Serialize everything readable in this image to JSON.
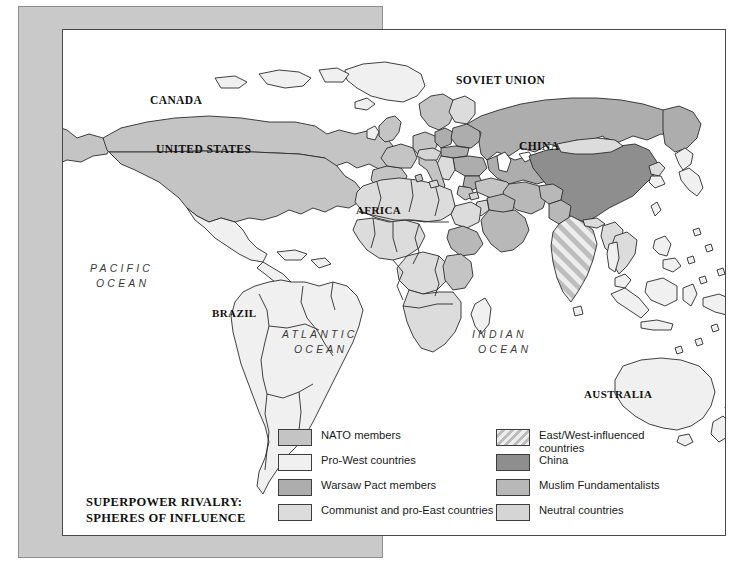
{
  "title": {
    "line1": "SUPERPOWER RIVALRY:",
    "line2": "SPHERES OF INFLUENCE"
  },
  "country_labels": [
    {
      "name": "canada",
      "text": "CANADA",
      "x": 87,
      "y": 70,
      "size": 11.5
    },
    {
      "name": "united-states",
      "text": "UNITED STATES",
      "x": 93,
      "y": 119,
      "size": 11.5
    },
    {
      "name": "soviet-union",
      "text": "SOVIET UNION",
      "x": 455,
      "y": 70,
      "size": 11.5
    },
    {
      "name": "china",
      "text": "CHINA",
      "x": 525,
      "y": 138,
      "size": 11.5
    },
    {
      "name": "africa",
      "text": "AFRICA",
      "x": 355,
      "y": 200,
      "size": 11.0
    },
    {
      "name": "brazil",
      "text": "BRAZIL",
      "x": 210,
      "y": 303,
      "size": 11.0
    },
    {
      "name": "australia",
      "text": "AUSTRALIA",
      "x": 583,
      "y": 386,
      "size": 11.0
    }
  ],
  "ocean_labels": [
    {
      "name": "pacific-ocean",
      "line1": "PACIFIC",
      "line2": "OCEAN",
      "x": 88,
      "y": 259,
      "size": 10.5
    },
    {
      "name": "atlantic-ocean",
      "line1": "ATLANTIC",
      "line2": "OCEAN",
      "x": 280,
      "y": 325,
      "size": 10.5
    },
    {
      "name": "indian-ocean",
      "line1": "INDIAN",
      "line2": "OCEAN",
      "x": 470,
      "y": 325,
      "size": 10.5
    }
  ],
  "legend": {
    "items": [
      {
        "name": "nato-members",
        "label": "NATO members",
        "swatch": "solid",
        "color": "#c4c4c4",
        "column": 0,
        "row": 0
      },
      {
        "name": "pro-west-countries",
        "label": "Pro-West countries",
        "swatch": "solid",
        "color": "#f0f0f0",
        "column": 0,
        "row": 1
      },
      {
        "name": "warsaw-pact-members",
        "label": "Warsaw Pact members",
        "swatch": "solid",
        "color": "#adadad",
        "column": 0,
        "row": 2
      },
      {
        "name": "communist-pro-east",
        "label": "Communist and pro-East countries",
        "swatch": "solid",
        "color": "#dcdcdc",
        "column": 0,
        "row": 3
      },
      {
        "name": "east-west-influenced",
        "label": "East/West-influenced countries",
        "swatch": "striped",
        "color": "#ededed",
        "column": 1,
        "row": 0
      },
      {
        "name": "china",
        "label": "China",
        "swatch": "solid",
        "color": "#8e8e8e",
        "column": 1,
        "row": 1
      },
      {
        "name": "muslim-fundamentalists",
        "label": "Muslim Fundamentalists",
        "swatch": "solid",
        "color": "#b8b8b8",
        "column": 1,
        "row": 2
      },
      {
        "name": "neutral-countries",
        "label": "Neutral countries",
        "swatch": "solid",
        "color": "#d5d5d5",
        "column": 1,
        "row": 3
      }
    ]
  },
  "colors": {
    "nato": "#c4c4c4",
    "pro_west": "#f0f0f0",
    "warsaw_pact": "#adadad",
    "communist": "#dcdcdc",
    "china": "#8e8e8e",
    "muslim": "#b8b8b8",
    "neutral": "#d5d5d5",
    "outline": "#2b2b2b",
    "backdrop": "#c9c9c9",
    "frame_border": "#4a4a4a",
    "ocean": "#ffffff"
  }
}
